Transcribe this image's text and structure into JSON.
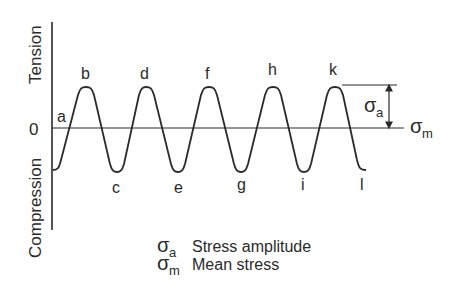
{
  "diagram": {
    "title": "",
    "axis": {
      "tension_label": "Tension",
      "compression_label": "Compression",
      "zero_label": "0"
    },
    "points": {
      "a": "a",
      "b": "b",
      "c": "c",
      "d": "d",
      "e": "e",
      "f": "f",
      "g": "g",
      "h": "h",
      "i": "i",
      "k": "k",
      "l": "l"
    },
    "annotations": {
      "sigma_a": "σ",
      "sigma_a_sub": "a",
      "sigma_m": "σ",
      "sigma_m_sub": "m"
    },
    "legend": [
      {
        "symbol": "σ",
        "sub": "a",
        "text": "Stress amplitude"
      },
      {
        "symbol": "σ",
        "sub": "m",
        "text": "Mean stress"
      }
    ],
    "colors": {
      "line": "#2a2a2a",
      "background": "#ffffff"
    }
  }
}
